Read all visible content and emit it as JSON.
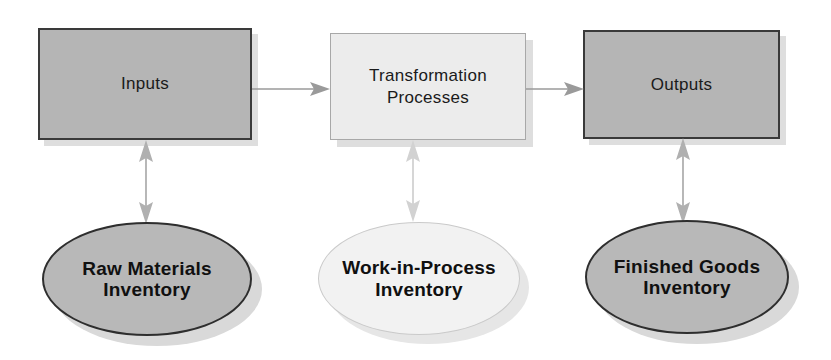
{
  "diagram": {
    "type": "flow-diagram",
    "background_color": "#ffffff",
    "process_boxes": [
      {
        "id": "inputs",
        "label": "Inputs",
        "fill": "#b5b5b5",
        "border": "#3a3a3a",
        "style": "dark"
      },
      {
        "id": "transformation-processes",
        "label": "Transformation\nProcesses",
        "fill": "#ececec",
        "border": "#a8a8a8",
        "style": "light"
      },
      {
        "id": "outputs",
        "label": "Outputs",
        "fill": "#b5b5b5",
        "border": "#3a3a3a",
        "style": "dark"
      }
    ],
    "inventory_ellipses": [
      {
        "id": "raw-materials-inventory",
        "label": "Raw Materials\nInventory",
        "fill": "#b8b8b8",
        "border": "#2e2e2e",
        "style": "dark"
      },
      {
        "id": "work-in-process-inventory",
        "label": "Work-in-Process\nInventory",
        "fill": "#f2f2f2",
        "border": "#cacaca",
        "style": "light"
      },
      {
        "id": "finished-goods-inventory",
        "label": "Finished Goods\nInventory",
        "fill": "#b8b8b8",
        "border": "#2e2e2e",
        "style": "dark"
      }
    ],
    "connectors": [
      {
        "id": "inputs-to-transformation",
        "from": "inputs",
        "to": "transformation-processes",
        "direction": "right",
        "color": "#9a9a9a"
      },
      {
        "id": "transformation-to-outputs",
        "from": "transformation-processes",
        "to": "outputs",
        "direction": "right",
        "color": "#9a9a9a"
      },
      {
        "id": "inputs-to-raw-materials",
        "from": "inputs",
        "to": "raw-materials-inventory",
        "direction": "both",
        "color": "#b0b0b0"
      },
      {
        "id": "transformation-to-work-in-process",
        "from": "transformation-processes",
        "to": "work-in-process-inventory",
        "direction": "both",
        "color": "#cfcfcf"
      },
      {
        "id": "outputs-to-finished-goods",
        "from": "outputs",
        "to": "finished-goods-inventory",
        "direction": "both",
        "color": "#b0b0b0"
      }
    ]
  }
}
